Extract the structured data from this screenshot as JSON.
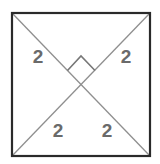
{
  "diagram": {
    "shape": "square",
    "colors": {
      "border": "#2a2a2a",
      "diagonal": "#8a8a8a",
      "label": "#6a6a6a"
    },
    "labels": {
      "top_left": "2",
      "top_right": "2",
      "bottom_left": "2",
      "bottom_right": "2"
    },
    "right_angle_marker": true
  }
}
